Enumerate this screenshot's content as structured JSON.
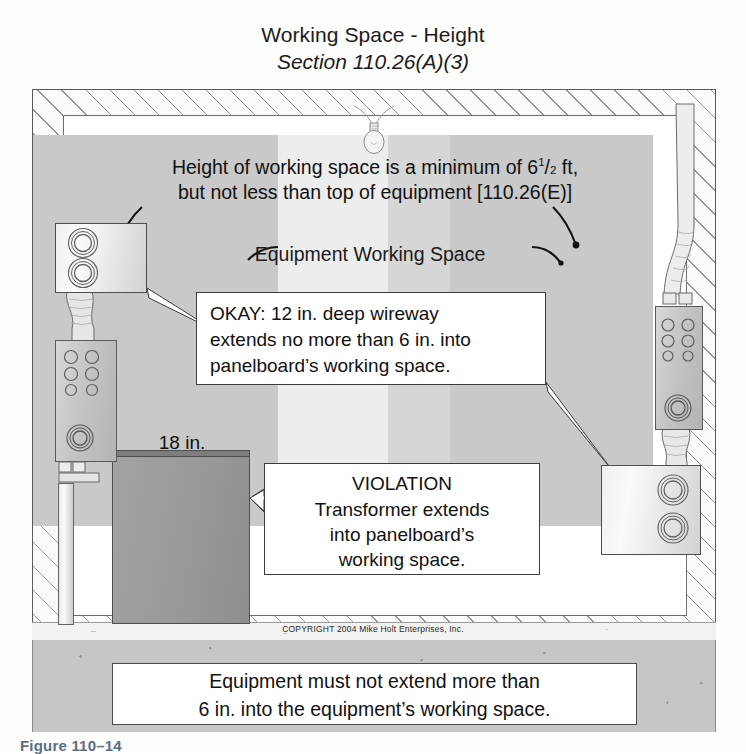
{
  "title": {
    "line1": "Working Space - Height",
    "line2": "Section 110.26(A)(3)"
  },
  "header_note": {
    "line1_pre": "Height of working space is a minimum of 6",
    "fraction_num": "1",
    "fraction_den": "2",
    "line1_post": " ft,",
    "line2": "but not less than top of equipment [110.26(E)]"
  },
  "labels": {
    "working_space": "Equipment Working Space",
    "dimension_18in": "18 in."
  },
  "callouts": {
    "okay": {
      "line1": "OKAY: 12 in. deep wireway",
      "line2": "extends no more than 6 in. into",
      "line3": "panelboard’s working space."
    },
    "violation": {
      "title": "VIOLATION",
      "line1": "Transformer extends",
      "line2": "into panelboard’s",
      "line3": "working space."
    }
  },
  "bottom_note": {
    "line1": "Equipment must not extend more than",
    "line2": "6 in. into the equipment’s working space."
  },
  "copyright": "COPYRIGHT 2004  Mike Holt Enterprises, Inc.",
  "figure_caption": "Figure 110–14",
  "colors": {
    "back_wall": "#c9c9c9",
    "working_space_band": "#ededed",
    "transformer": "#9a9a9a",
    "floor": "#c6c6c6",
    "text": "#111111",
    "caption": "#5e6d86"
  },
  "icons": {
    "ceiling_light": "light-bulb-icon",
    "dimension_arrow": "dimension-arrow-icon"
  }
}
